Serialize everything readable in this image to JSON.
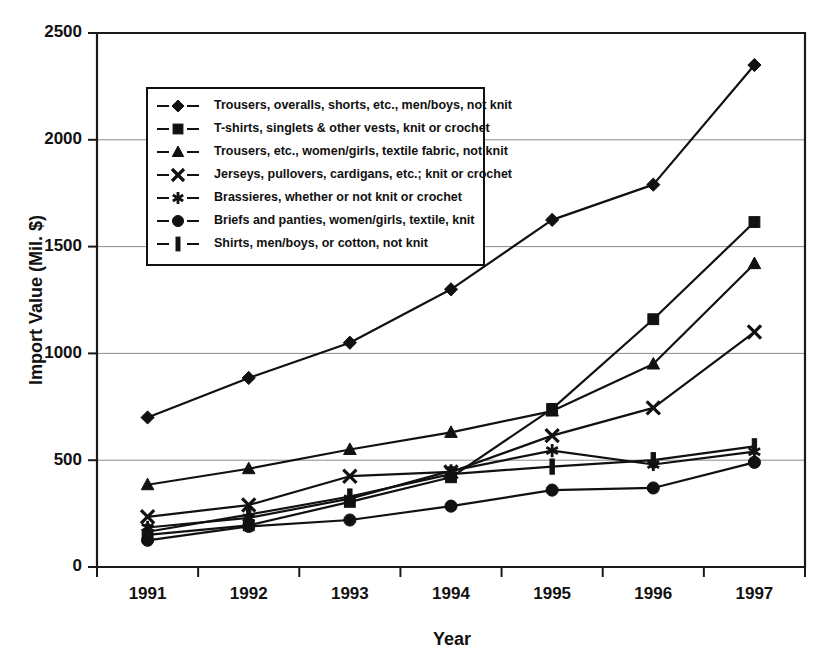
{
  "chart_data": {
    "type": "line",
    "title": "",
    "xlabel": "Year",
    "ylabel": "Import Value (Mil. $)",
    "categories": [
      "1991",
      "1992",
      "1993",
      "1994",
      "1995",
      "1996",
      "1997"
    ],
    "x": [
      1991,
      1992,
      1993,
      1994,
      1995,
      1996,
      1997
    ],
    "ylim": [
      0,
      2500
    ],
    "yticks": [
      0,
      500,
      1000,
      1500,
      2000,
      2500
    ],
    "ytick_labels": [
      "0",
      "500",
      "1000",
      "1500",
      "2000",
      "2500"
    ],
    "grid": true,
    "legend_position": "upper-left-inside",
    "series": [
      {
        "name": "Trousers, overalls, shorts, etc., men/boys, not knit",
        "marker": "diamond",
        "values": [
          700,
          885,
          1050,
          1300,
          1625,
          1790,
          2350
        ]
      },
      {
        "name": "T-shirts, singlets & other vests, knit or crochet",
        "marker": "square",
        "values": [
          150,
          195,
          305,
          420,
          740,
          1160,
          1615
        ]
      },
      {
        "name": "Trousers, etc., women/girls, textile fabric, not knit",
        "marker": "triangle",
        "values": [
          385,
          460,
          550,
          630,
          730,
          950,
          1420
        ]
      },
      {
        "name": "Jerseys, pullovers, cardigans, etc.; knit or crochet",
        "marker": "cross",
        "values": [
          235,
          290,
          425,
          445,
          615,
          745,
          1100
        ]
      },
      {
        "name": "Brassieres, whether or not knit or crochet",
        "marker": "asterisk",
        "values": [
          185,
          230,
          320,
          450,
          545,
          480,
          540
        ]
      },
      {
        "name": "Briefs and panties, women/girls, textile, knit",
        "marker": "circle",
        "values": [
          125,
          190,
          220,
          285,
          360,
          370,
          490
        ]
      },
      {
        "name": "Shirts, men/boys, or cotton, not knit",
        "marker": "bar",
        "values": [
          165,
          245,
          330,
          435,
          470,
          500,
          565
        ]
      }
    ]
  },
  "axes": {
    "y_title": "Import Value (Mil. $)",
    "x_title": "Year"
  }
}
